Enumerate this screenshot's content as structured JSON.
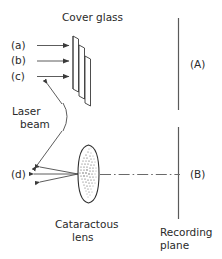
{
  "figure": {
    "title": "Cover glass",
    "labels": {
      "a": "(a)",
      "b": "(b)",
      "c": "(c)",
      "d": "(d)",
      "A": "(A)",
      "B": "(B)"
    },
    "annotations": {
      "laser_line1": "Laser",
      "laser_line2": "beam",
      "lens_line1": "Cataractous",
      "lens_line2": "lens",
      "plane_line1": "Recording",
      "plane_line2": "plane"
    },
    "colors": {
      "background": "#ffffff",
      "ink": "#2a2a2a",
      "line": "#3a3a3a",
      "plane": "#5a5a5a",
      "axis": "#6a6a6a",
      "speckle": "#4a4a4a"
    }
  }
}
